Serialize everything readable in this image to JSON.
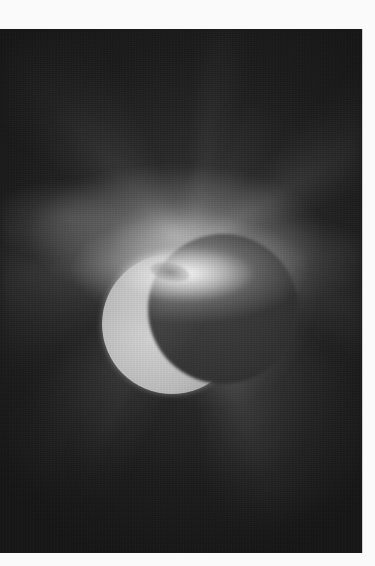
{
  "image": {
    "subject": "comet-like corona rays around crescent moon",
    "style": "grayscale astronomical photograph",
    "colors": {
      "page_background": "#fafafa",
      "sky": "#1b1b1b",
      "corona_core": "#f2f2f2",
      "moon": "#c4c4c4"
    }
  },
  "caption": {
    "text": ""
  }
}
